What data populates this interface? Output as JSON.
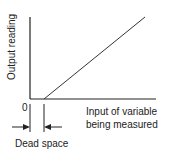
{
  "diagram": {
    "y_axis_label": "Output reading",
    "x_axis_label_line1": "Input of variable",
    "x_axis_label_line2": "being measured",
    "origin_label": "0",
    "dead_space_label": "Dead space",
    "line_color": "#333333"
  }
}
